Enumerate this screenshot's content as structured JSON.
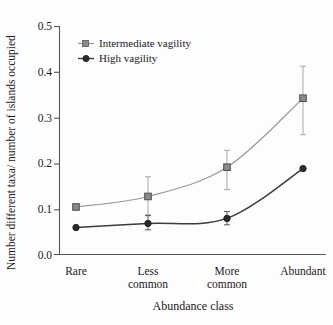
{
  "chart_data": {
    "type": "line",
    "title": "",
    "xlabel": "Abundance class",
    "ylabel": "Number different taxa/ number of islands occupied",
    "categories": [
      "Rare",
      "Less common",
      "More common",
      "Abundant"
    ],
    "category_lines": [
      [
        "Rare"
      ],
      [
        "Less",
        "common"
      ],
      [
        "More",
        "common"
      ],
      [
        "Abundant"
      ]
    ],
    "ylim": [
      0.0,
      0.5
    ],
    "yticks": [
      "0.0",
      "0.1",
      "0.2",
      "0.3",
      "0.4",
      "0.5"
    ],
    "ytick_values": [
      0.0,
      0.1,
      0.2,
      0.3,
      0.4,
      0.5
    ],
    "grid": false,
    "legend_position": "top-left-inside",
    "series": [
      {
        "name": "Intermediate vagility",
        "color": "#9a9a9a",
        "marker": "square",
        "marker_fill": "#8a8a8a",
        "values": [
          0.104,
          0.127,
          0.191,
          0.342
        ],
        "err_low": [
          0.104,
          0.087,
          0.142,
          0.262
        ],
        "err_high": [
          0.104,
          0.17,
          0.228,
          0.412
        ]
      },
      {
        "name": "High vagility",
        "color": "#3c3c3c",
        "marker": "circle",
        "marker_fill": "#2b2b2b",
        "values": [
          0.059,
          0.068,
          0.079,
          0.188
        ],
        "err_low": [
          0.059,
          0.054,
          0.065,
          0.188
        ],
        "err_high": [
          0.059,
          0.085,
          0.094,
          0.188
        ]
      }
    ]
  },
  "legend": {
    "items": [
      {
        "label": "Intermediate vagility"
      },
      {
        "label": "High vagility"
      }
    ]
  },
  "axes": {
    "y_label": "Number different taxa/ number of islands occupied",
    "x_label": "Abundance class",
    "y_ticks": [
      "0.5",
      "0.4",
      "0.3",
      "0.2",
      "0.1",
      "0.0"
    ]
  },
  "colors": {
    "intermediate": "#9a9a9a",
    "high": "#3c3c3c",
    "axis": "#555555",
    "background": "#fdfdfd"
  }
}
